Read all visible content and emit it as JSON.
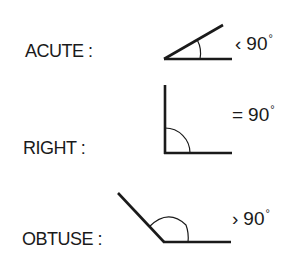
{
  "diagram": {
    "type": "angle-classification",
    "rows": [
      {
        "id": "acute",
        "label": "ACUTE :",
        "operator": "‹",
        "value": "90",
        "degree_symbol": "°",
        "meaning": "less than 90 degrees"
      },
      {
        "id": "right",
        "label": "RIGHT :",
        "operator": "=",
        "value": "90",
        "degree_symbol": "°",
        "meaning": "equal to 90 degrees"
      },
      {
        "id": "obtuse",
        "label": "OBTUSE :",
        "operator": "›",
        "value": "90",
        "degree_symbol": "°",
        "meaning": "greater than 90 degrees"
      }
    ],
    "colors": {
      "stroke": "#1a1a1a",
      "background": "#ffffff"
    }
  }
}
